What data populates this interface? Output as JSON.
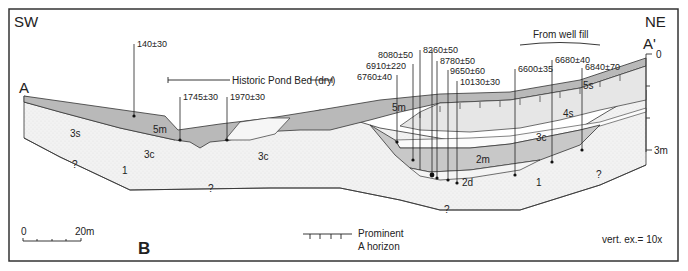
{
  "figure": {
    "panel_label": "B",
    "orientation": {
      "left": "SW",
      "right": "NE"
    },
    "section_ends": {
      "left": "A",
      "right": "A'"
    },
    "annotations": {
      "historic_pond": "Historic Pond Bed (dry)",
      "well_fill": "From well fill"
    },
    "scale_bar": {
      "start": "0",
      "end": "20m"
    },
    "vertical_axis": {
      "top": "0",
      "bottom": "3m"
    },
    "vertical_exaggeration": "vert. ex.= 10x",
    "legend": {
      "line1": "Prominent",
      "line2": "A horizon"
    },
    "units": {
      "u1_left": "1",
      "u1_right": "1",
      "u2m": "2m",
      "u2d": "2d",
      "u3s": "3s",
      "u3c_a": "3c",
      "u3c_b": "3c",
      "u3c_c": "3c",
      "u4s": "4s",
      "u5s": "5s",
      "u5m_a": "5m",
      "u5m_b": "5m"
    },
    "unknown_marks": [
      "?",
      "?",
      "?",
      "?",
      "?"
    ],
    "dates": [
      {
        "id": "d140",
        "label": "140±30"
      },
      {
        "id": "d1745",
        "label": "1745±30"
      },
      {
        "id": "d1970",
        "label": "1970±30"
      },
      {
        "id": "d6760",
        "label": "6760±40"
      },
      {
        "id": "d6910",
        "label": "6910±220"
      },
      {
        "id": "d8080",
        "label": "8080±50"
      },
      {
        "id": "d8260",
        "label": "8260±50"
      },
      {
        "id": "d8780",
        "label": "8780±50"
      },
      {
        "id": "d9650",
        "label": "9650±60"
      },
      {
        "id": "d10130",
        "label": "10130±30"
      },
      {
        "id": "d6600",
        "label": "6600±35"
      },
      {
        "id": "d6680",
        "label": "6680±40"
      },
      {
        "id": "d6840",
        "label": "6840±70"
      }
    ],
    "colors": {
      "unit5m": "#b9b9b9",
      "unit2m": "#c8c8c8",
      "unit4s": "#e6e6e6",
      "unit1": "#f0f0f0",
      "light": "#f7f7f7",
      "line": "#2a2a2a"
    }
  }
}
